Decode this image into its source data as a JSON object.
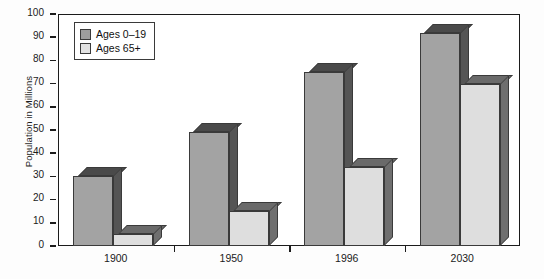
{
  "chart_data": {
    "type": "bar",
    "title": "",
    "xlabel": "",
    "ylabel": "Population in Millions",
    "categories": [
      "1900",
      "1950",
      "1996",
      "2030"
    ],
    "series": [
      {
        "name": "Ages 0–19",
        "values": [
          30,
          49,
          75,
          92
        ],
        "color": "#a3a3a3"
      },
      {
        "name": "Ages 65+",
        "values": [
          5,
          15,
          34,
          70
        ],
        "color": "#dedede"
      }
    ],
    "ylim": [
      0,
      100
    ],
    "yticks": [
      0,
      10,
      20,
      30,
      40,
      50,
      60,
      70,
      80,
      90,
      100
    ],
    "ytick_labels": [
      "0",
      "10",
      "20",
      "30",
      "40",
      "50",
      "60",
      "70",
      "80",
      "90",
      "100"
    ],
    "grid": false,
    "legend_position": "top-left",
    "style": "3d-bars-grayscale"
  },
  "legend": {
    "items": [
      {
        "label": "Ages 0–19",
        "swatch": "#9d9d9d"
      },
      {
        "label": "Ages 65+",
        "swatch": "#e2e2e2"
      }
    ]
  },
  "axis": {
    "y_title": "Population in Millions"
  }
}
